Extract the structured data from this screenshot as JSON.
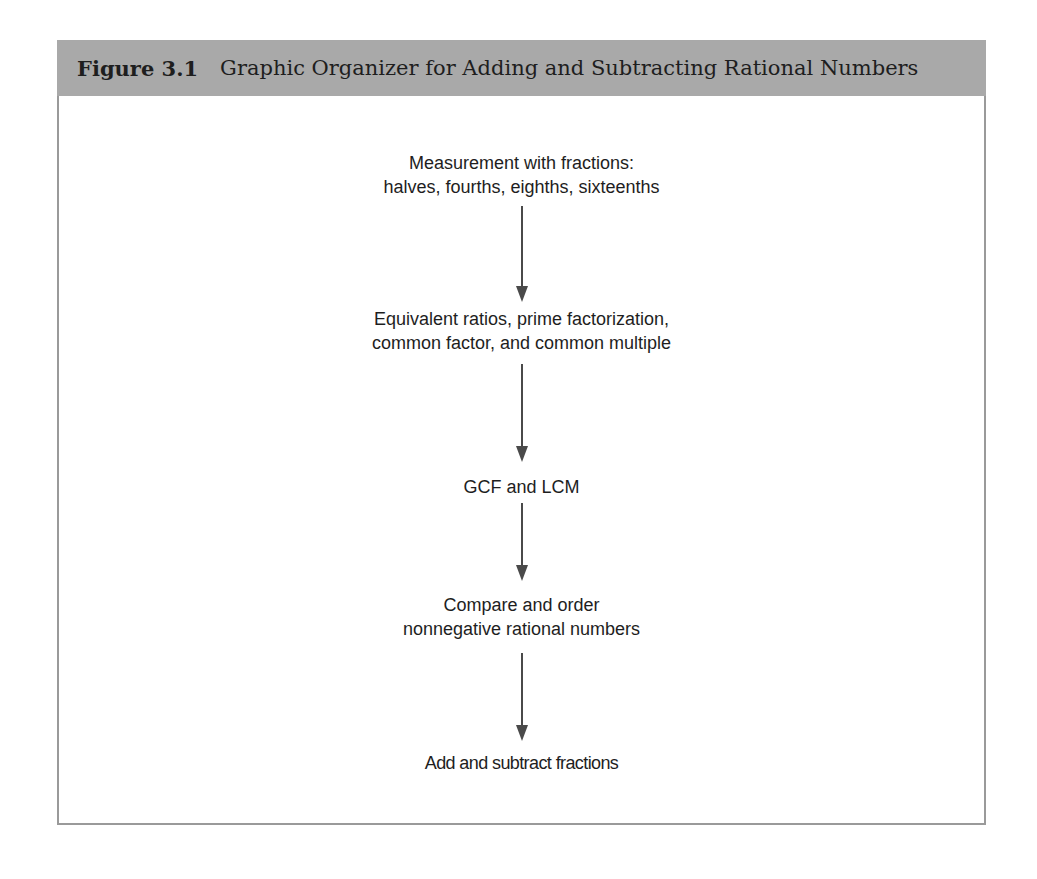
{
  "figure": {
    "number": "Figure 3.1",
    "title": "Graphic Organizer for Adding and Subtracting Rational Numbers",
    "header_color": "#a9a9a9",
    "border_color": "#9a9a9a",
    "arrow_color": "#4a4a4a"
  },
  "flow": {
    "nodes": [
      {
        "line1": "Measurement with fractions:",
        "line2": "halves, fourths, eighths, sixteenths"
      },
      {
        "line1": "Equivalent ratios, prime factorization,",
        "line2": "common factor, and common multiple"
      },
      {
        "line1": "GCF and LCM"
      },
      {
        "line1": "Compare and order",
        "line2": "nonnegative rational numbers"
      },
      {
        "line1": "Add and subtract fractions"
      }
    ],
    "arrows": [
      "down-arrow",
      "down-arrow",
      "down-arrow",
      "down-arrow"
    ]
  }
}
